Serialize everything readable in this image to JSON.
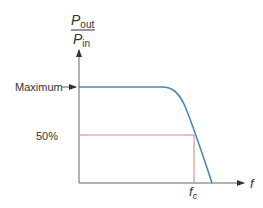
{
  "diagram": {
    "y_axis": {
      "numerator": "P",
      "numerator_sub": "out",
      "denominator": "P",
      "denominator_sub": "in"
    },
    "x_axis": {
      "label": "f"
    },
    "labels": {
      "maximum": "Maximum",
      "half": "50%",
      "cutoff": "f",
      "cutoff_sub": "c"
    },
    "colors": {
      "curve": "#4a86b8",
      "guide": "#e0807a",
      "axis": "#555555"
    }
  }
}
